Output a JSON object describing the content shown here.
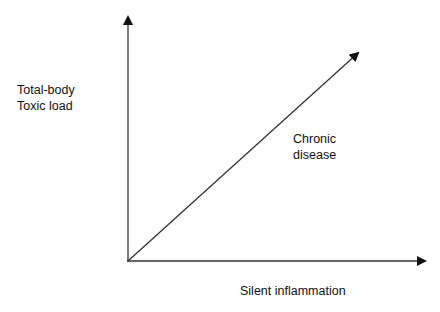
{
  "diagram": {
    "y_axis_label_line1": "Total-body",
    "y_axis_label_line2": "Toxic load",
    "x_axis_label": "Silent inflammation",
    "diagonal_label_line1": "Chronic",
    "diagonal_label_line2": "disease",
    "line_color": "#222222"
  }
}
